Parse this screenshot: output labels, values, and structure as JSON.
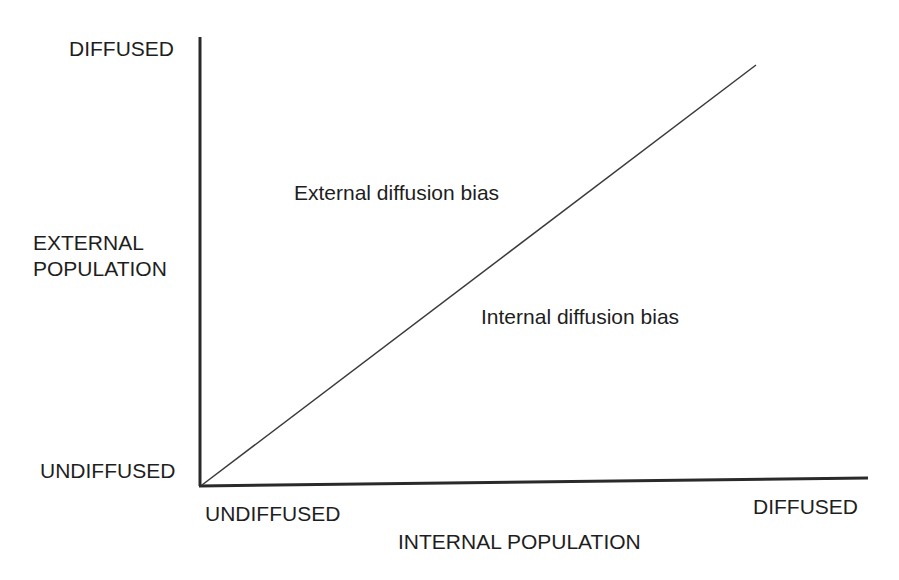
{
  "diagram": {
    "y_axis": {
      "title_line1": "EXTERNAL",
      "title_line2": "POPULATION",
      "top_label": "DIFFUSED",
      "bottom_label": "UNDIFFUSED"
    },
    "x_axis": {
      "title": "INTERNAL POPULATION",
      "left_label": "UNDIFFUSED",
      "right_label": "DIFFUSED"
    },
    "regions": {
      "upper": "External diffusion bias",
      "lower": "Internal diffusion bias"
    },
    "colors": {
      "line": "#2a2a2a",
      "text": "#1e1e1e",
      "background": "#ffffff"
    }
  }
}
